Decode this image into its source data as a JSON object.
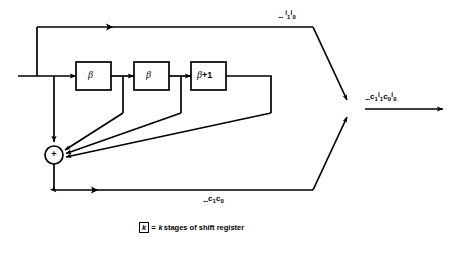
{
  "figure": {
    "type": "block-diagram",
    "background_color": "#ffffff",
    "line_color": "#000000"
  },
  "blocks": [
    {
      "id": "beta-1",
      "label": "β",
      "x": 76,
      "y": 62,
      "w": 35,
      "h": 28
    },
    {
      "id": "beta-2",
      "label": "β",
      "x": 134,
      "y": 62,
      "w": 35,
      "h": 28
    },
    {
      "id": "beta-plus-1",
      "label": "β+1",
      "x": 191,
      "y": 62,
      "w": 35,
      "h": 28
    }
  ],
  "adder": {
    "id": "modulo-adder",
    "symbol": "+",
    "cx": 54,
    "cy": 155,
    "r": 9
  },
  "labels": {
    "top_line": {
      "dots": "...",
      "terms": [
        "i",
        "1",
        "i",
        "0"
      ],
      "text": "... i1i0"
    },
    "output_line": {
      "dots": "...",
      "terms": [
        "c",
        "1",
        "i",
        "1",
        "c",
        "0",
        "i",
        "0"
      ],
      "text": "...c1i1c0i0"
    },
    "bottom_line": {
      "dots": "...",
      "terms": [
        "c",
        "1",
        "c",
        "0"
      ],
      "text": "...c1c0"
    }
  },
  "caption": {
    "box_symbol": "k",
    "equals": "=",
    "text_italic_k": "k",
    "text_rest": " stages of shift register",
    "full": "k = k stages of shift register"
  },
  "icons": {
    "arrow_right": "arrow-right-icon",
    "arrow_down": "arrow-down-icon",
    "plus": "plus-icon"
  }
}
